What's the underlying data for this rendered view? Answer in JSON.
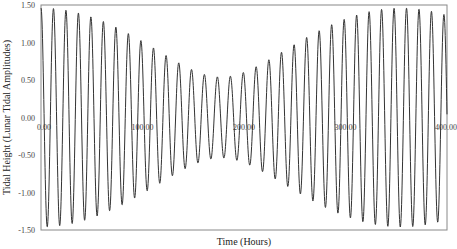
{
  "chart_data": {
    "type": "line",
    "title": "",
    "xlabel": "Time (Hours)",
    "ylabel": "Tidal Height (Lunar Tidal Amplitudes)",
    "xlim": [
      0,
      400
    ],
    "ylim": [
      -1.5,
      1.5
    ],
    "x_ticks": [
      0,
      100,
      200,
      300,
      400
    ],
    "x_tick_labels": [
      "0.00",
      "100.00",
      "200.00",
      "300.00",
      "400.00"
    ],
    "y_ticks": [
      -1.5,
      -1.0,
      -0.5,
      0.0,
      0.5,
      1.0,
      1.5
    ],
    "y_tick_labels": [
      "-1.50",
      "-1.00",
      "-0.50",
      "0.00",
      "0.50",
      "1.00",
      "1.50"
    ],
    "grid": false,
    "legend": "none",
    "series": [
      {
        "name": "Tidal height",
        "description": "Sum of lunar semidiurnal (M2) and solar semidiurnal (S2) constituents showing spring-neap modulation",
        "components": [
          {
            "name": "M2",
            "amplitude": 1.0,
            "period_hours": 12.42
          },
          {
            "name": "S2",
            "amplitude": 0.46,
            "period_hours": 12.0
          }
        ],
        "sample_step_hours": 0.25,
        "max_amplitude": 1.46,
        "min_envelope": 0.54,
        "spring_times_hours": [
          0,
          354
        ],
        "neap_time_hours": 177
      }
    ]
  }
}
